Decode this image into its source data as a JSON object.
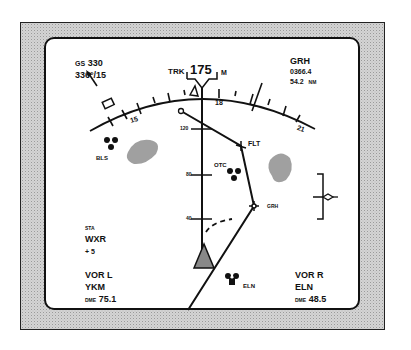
{
  "display": {
    "type": "navigation-display-map-mode",
    "colors": {
      "ink": "#111111",
      "screen": "#ffffff",
      "bezel_pattern": "#d4d4d4",
      "weather": "#9a9a9a"
    }
  },
  "top_left": {
    "gs_label": "GS",
    "gs_value": "330",
    "wind": "336°/15",
    "wind_arrow_icon": "wind-arrow-icon"
  },
  "heading": {
    "trk_label": "TRK",
    "value": "175",
    "ref": "M"
  },
  "compass": {
    "labels": [
      "15",
      "18",
      "21"
    ]
  },
  "top_right": {
    "waypoint": "GRH",
    "eta": "0366.4",
    "distance": "54.2",
    "distance_unit": "NM"
  },
  "range_marks": [
    "120",
    "80",
    "40"
  ],
  "waypoints": [
    {
      "id": "FLT",
      "label": "FLT"
    },
    {
      "id": "GRH",
      "label": "GRH"
    }
  ],
  "navaids": [
    {
      "id": "BLS",
      "label": "BLS"
    },
    {
      "id": "OTC",
      "label": "OTC"
    },
    {
      "id": "ELN",
      "label": "ELN"
    }
  ],
  "bottom_left": {
    "sta": "STA",
    "wxr": "WXR",
    "tilt": "+ 5",
    "vor_l": "VOR L",
    "vor_l_id": "YKM",
    "dme_label": "DME",
    "dme_value": "75.1"
  },
  "bottom_right": {
    "vor_r": "VOR R",
    "vor_r_id": "ELN",
    "dme_label": "DME",
    "dme_value": "48.5"
  }
}
